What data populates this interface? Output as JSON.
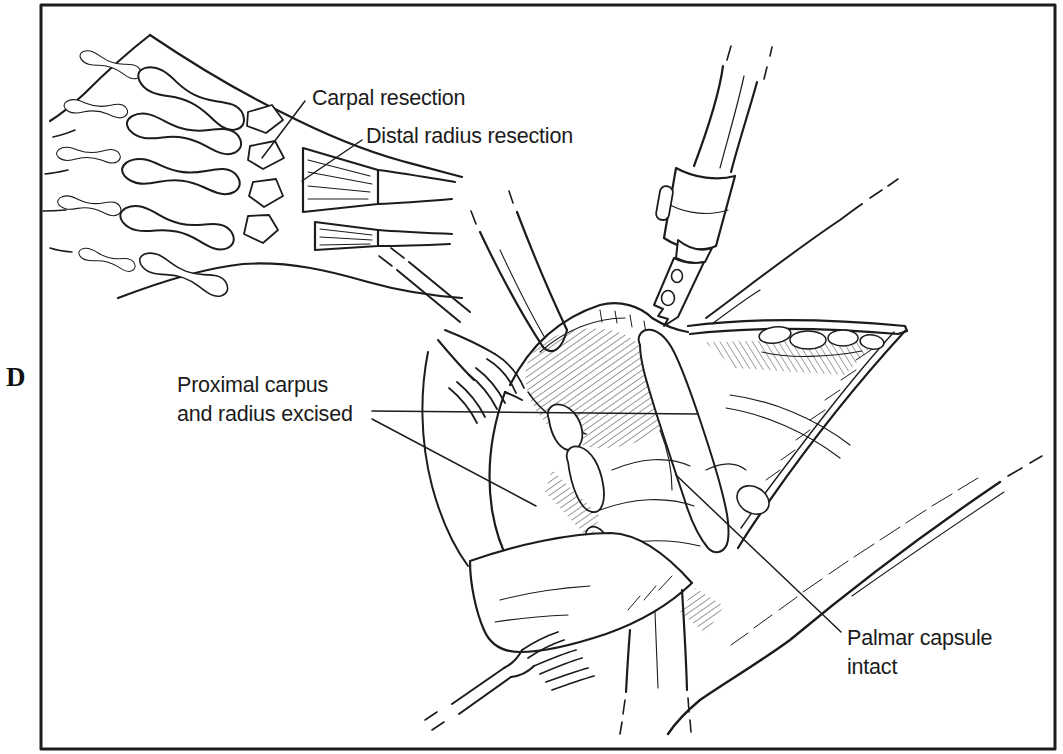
{
  "figure": {
    "panel_label": "D",
    "background_color": "#ffffff",
    "ink_color": "#1c1c1c",
    "annotations": {
      "carpal_resection": "Carpal resection",
      "distal_radius_resection": "Distal radius resection",
      "proximal_carpus_excised": "Proximal carpus\nand radius excised",
      "palmar_capsule_intact": "Palmar capsule\nintact"
    }
  }
}
